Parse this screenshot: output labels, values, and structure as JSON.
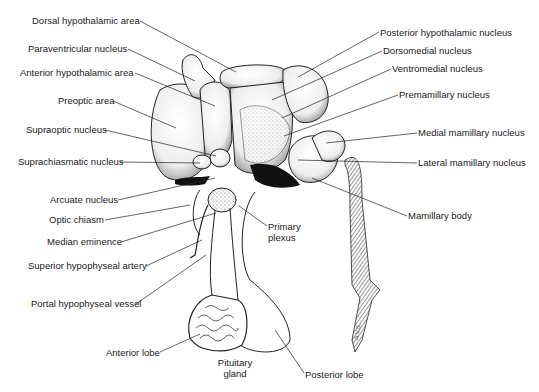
{
  "figure": {
    "signature": "A.V.S."
  },
  "labels_left": [
    {
      "text": "Dorsal hypothalamic area",
      "x": 32,
      "y": 15
    },
    {
      "text": "Paraventricular nucleus",
      "x": 28,
      "y": 43
    },
    {
      "text": "Anterior hypothalamic area",
      "x": 20,
      "y": 67
    },
    {
      "text": "Preoptic area",
      "x": 58,
      "y": 95
    },
    {
      "text": "Supraoptic nucleus",
      "x": 26,
      "y": 124
    },
    {
      "text": "Suprachiasmatic nucleus",
      "x": 18,
      "y": 156
    },
    {
      "text": "Arcuate nucleus",
      "x": 50,
      "y": 194
    },
    {
      "text": "Optic chiasm",
      "x": 49,
      "y": 214
    },
    {
      "text": "Median eminence",
      "x": 47,
      "y": 236
    },
    {
      "text": "Superior hypophyseal artery",
      "x": 28,
      "y": 260
    },
    {
      "text": "Portal hypophyseal vessel",
      "x": 31,
      "y": 298
    },
    {
      "text": "Anterior lobe",
      "x": 106,
      "y": 347
    }
  ],
  "labels_right": [
    {
      "text": "Posterior hypothalamic nucleus",
      "x": 380,
      "y": 27
    },
    {
      "text": "Dorsomedial nucleus",
      "x": 383,
      "y": 45
    },
    {
      "text": "Ventromedial nucleus",
      "x": 392,
      "y": 63
    },
    {
      "text": "Premamillary nucleus",
      "x": 399,
      "y": 89
    },
    {
      "text": "Medial mamillary nucleus",
      "x": 418,
      "y": 127
    },
    {
      "text": "Lateral mamillary nucleus",
      "x": 418,
      "y": 157
    },
    {
      "text": "Mamillary body",
      "x": 408,
      "y": 210
    },
    {
      "text": "Posterior lobe",
      "x": 305,
      "y": 369
    }
  ],
  "labels_center": [
    {
      "text": "Primary plexus",
      "x": 268,
      "y": 221
    },
    {
      "text": "Pituitary gland",
      "x": 215,
      "y": 357
    }
  ],
  "colors": {
    "ink": "#1a1a1a",
    "background": "#ffffff",
    "shade": "#4a4a4a"
  }
}
